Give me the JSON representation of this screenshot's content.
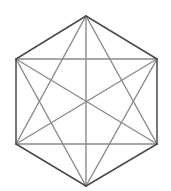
{
  "diagram": {
    "title": "",
    "colors": {
      "background": "#ffffff",
      "edge": "#4a4a4a",
      "diagonal": "#8a8a8a"
    },
    "vertices": [
      {
        "id": "top",
        "x": 86,
        "y": 16
      },
      {
        "id": "upper-right",
        "x": 157,
        "y": 59
      },
      {
        "id": "lower-right",
        "x": 157,
        "y": 144
      },
      {
        "id": "bottom",
        "x": 86,
        "y": 186
      },
      {
        "id": "lower-left",
        "x": 16,
        "y": 144
      },
      {
        "id": "upper-left",
        "x": 16,
        "y": 59
      }
    ],
    "edges": [
      [
        0,
        1
      ],
      [
        1,
        2
      ],
      [
        2,
        3
      ],
      [
        3,
        4
      ],
      [
        4,
        5
      ],
      [
        5,
        0
      ]
    ],
    "diagonals": [
      [
        0,
        2
      ],
      [
        0,
        3
      ],
      [
        0,
        4
      ],
      [
        1,
        3
      ],
      [
        1,
        4
      ],
      [
        1,
        5
      ],
      [
        2,
        4
      ],
      [
        2,
        5
      ],
      [
        3,
        5
      ]
    ]
  }
}
